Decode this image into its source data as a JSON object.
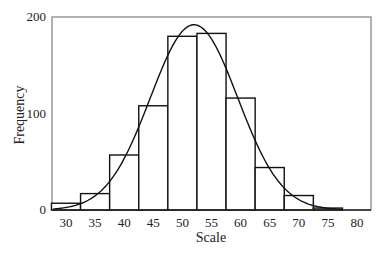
{
  "chart_data": {
    "type": "bar",
    "subtype": "histogram_with_normal_curve",
    "title": "",
    "xlabel": "Scale",
    "ylabel": "Frequency",
    "x_ticks": [
      30,
      35,
      40,
      45,
      50,
      55,
      60,
      65,
      70,
      75,
      80
    ],
    "y_ticks": [
      0,
      100,
      200
    ],
    "xlim": [
      27.5,
      82
    ],
    "ylim": [
      0,
      200
    ],
    "bin_width": 5,
    "categories": [
      "30",
      "35",
      "40",
      "45",
      "50",
      "55",
      "60",
      "65",
      "70",
      "75"
    ],
    "bins": [
      30,
      35,
      40,
      45,
      50,
      55,
      60,
      65,
      70,
      75
    ],
    "values": [
      7,
      17,
      57,
      108,
      180,
      183,
      116,
      44,
      15,
      2
    ],
    "curve": {
      "type": "normal",
      "mean": 52,
      "peak": 192,
      "sd": 7.5
    },
    "grid": false,
    "legend": null
  }
}
